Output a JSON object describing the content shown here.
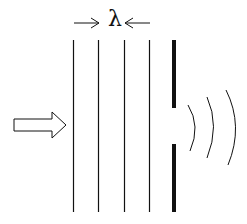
{
  "diagram": {
    "wavelength_label": "λ",
    "colors": {
      "stroke": "#111111",
      "background": "#ffffff"
    },
    "wavefronts": {
      "count": 4,
      "x": [
        73,
        98,
        124,
        149
      ],
      "y_top": 40,
      "y_bottom": 212
    },
    "barrier": {
      "x": 174,
      "top_segment": [
        40,
        108
      ],
      "bottom_segment": [
        144,
        212
      ],
      "slit_gap": [
        108,
        144
      ]
    },
    "incident_arrow": {
      "direction": "right"
    },
    "diffracted_waves": {
      "count": 3
    }
  }
}
